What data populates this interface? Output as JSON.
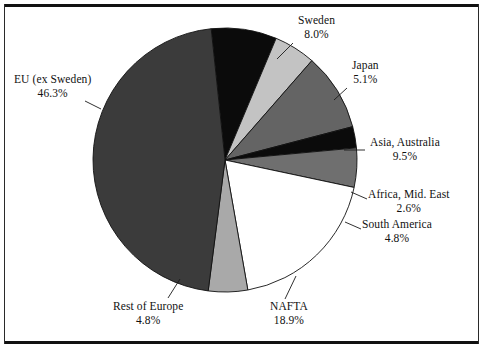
{
  "chart_data": {
    "type": "pie",
    "title": "",
    "subtitle": "",
    "xlabel": "",
    "ylabel": "",
    "legend_position": "none",
    "grid": false,
    "value_unit": "%",
    "total": 100.0,
    "categories": [
      "Sweden",
      "Japan",
      "Asia, Australia",
      "Africa, Mid. East",
      "South America",
      "NAFTA",
      "Rest of Europe",
      "EU (ex Sweden)"
    ],
    "values": [
      8.0,
      5.1,
      9.5,
      2.6,
      4.8,
      18.9,
      4.8,
      46.3
    ],
    "slices": [
      {
        "name": "Sweden",
        "value": 8.0,
        "label_value": "8.0%",
        "color": "#0b0b0b",
        "label_x": 298,
        "label_y": 14,
        "leader": {
          "x1": 293,
          "y1": 43,
          "x2": 277,
          "y2": 59
        }
      },
      {
        "name": "Japan",
        "value": 5.1,
        "label_value": "5.1%",
        "color": "#c3c3c3",
        "label_x": 352,
        "label_y": 59,
        "leader": {
          "x1": 347,
          "y1": 88,
          "x2": 334,
          "y2": 100
        }
      },
      {
        "name": "Asia, Australia",
        "value": 9.5,
        "label_value": "9.5%",
        "color": "#646464",
        "label_x": 370,
        "label_y": 136,
        "leader": {
          "x1": 365,
          "y1": 150,
          "x2": 344,
          "y2": 150
        }
      },
      {
        "name": "Africa, Mid. East",
        "value": 2.6,
        "label_value": "2.6%",
        "color": "#0b0b0b",
        "label_x": 368,
        "label_y": 188,
        "leader": {
          "x1": 367,
          "y1": 199,
          "x2": 351,
          "y2": 192
        }
      },
      {
        "name": "South America",
        "value": 4.8,
        "label_value": "4.8%",
        "color": "#6f6f6f",
        "label_x": 362,
        "label_y": 218,
        "leader": {
          "x1": 361,
          "y1": 229,
          "x2": 345,
          "y2": 222
        }
      },
      {
        "name": "NAFTA",
        "value": 18.9,
        "label_value": "18.9%",
        "color": "#ffffff",
        "label_x": 270,
        "label_y": 300,
        "leader": {
          "x1": 285,
          "y1": 299,
          "x2": 296,
          "y2": 276
        }
      },
      {
        "name": "Rest of Europe",
        "value": 4.8,
        "label_value": "4.8%",
        "color": "#a9a9a9",
        "label_x": 113,
        "label_y": 300,
        "leader": {
          "x1": 168,
          "y1": 298,
          "x2": 180,
          "y2": 279
        }
      },
      {
        "name": "EU (ex Sweden)",
        "value": 46.3,
        "label_value": "46.3%",
        "color": "#3b3b3b",
        "label_x": 14,
        "label_y": 73,
        "leader": {
          "x1": 85,
          "y1": 101,
          "x2": 101,
          "y2": 109
        }
      }
    ],
    "geometry": {
      "center_x": 225,
      "center_y": 160,
      "radius": 132,
      "start_angle_deg": -6
    },
    "colors": {
      "outline": "#111111",
      "background": "#ffffff",
      "frame": "#111111"
    }
  }
}
